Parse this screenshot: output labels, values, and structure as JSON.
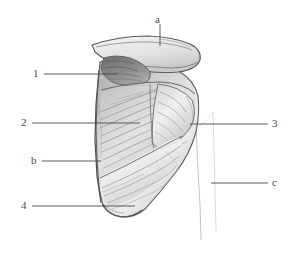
{
  "figure": {
    "kind": "anatomical-pencil-drawing",
    "medium": "graphite-pencil-sketch",
    "background_color": "#ffffff",
    "line_color": "#4a4a4a",
    "shading_color": "#8d8d8d",
    "label_color": "#4a4a4a"
  },
  "labels": [
    {
      "id": "a",
      "text": "a",
      "side": "top",
      "text_x": 155,
      "text_y": 14,
      "leader": {
        "x1": 160,
        "y1": 24,
        "x2": 160,
        "y2": 46
      }
    },
    {
      "id": "1",
      "text": "1",
      "side": "left",
      "text_x": 33,
      "text_y": 68,
      "leader": {
        "x1": 44,
        "y1": 74,
        "x2": 117,
        "y2": 74
      }
    },
    {
      "id": "2",
      "text": "2",
      "side": "left",
      "text_x": 21,
      "text_y": 117,
      "leader": {
        "x1": 32,
        "y1": 123,
        "x2": 140,
        "y2": 123
      }
    },
    {
      "id": "3",
      "text": "3",
      "side": "right",
      "text_x": 272,
      "text_y": 118,
      "leader": {
        "x1": 190,
        "y1": 124,
        "x2": 268,
        "y2": 124
      }
    },
    {
      "id": "b",
      "text": "b",
      "side": "left",
      "text_x": 31,
      "text_y": 155,
      "leader": {
        "x1": 42,
        "y1": 161,
        "x2": 101,
        "y2": 161
      }
    },
    {
      "id": "c",
      "text": "c",
      "side": "right",
      "text_x": 272,
      "text_y": 177,
      "leader": {
        "x1": 211,
        "y1": 183,
        "x2": 268,
        "y2": 183
      }
    },
    {
      "id": "4",
      "text": "4",
      "side": "left",
      "text_x": 21,
      "text_y": 200,
      "leader": {
        "x1": 32,
        "y1": 206,
        "x2": 135,
        "y2": 206
      }
    }
  ]
}
